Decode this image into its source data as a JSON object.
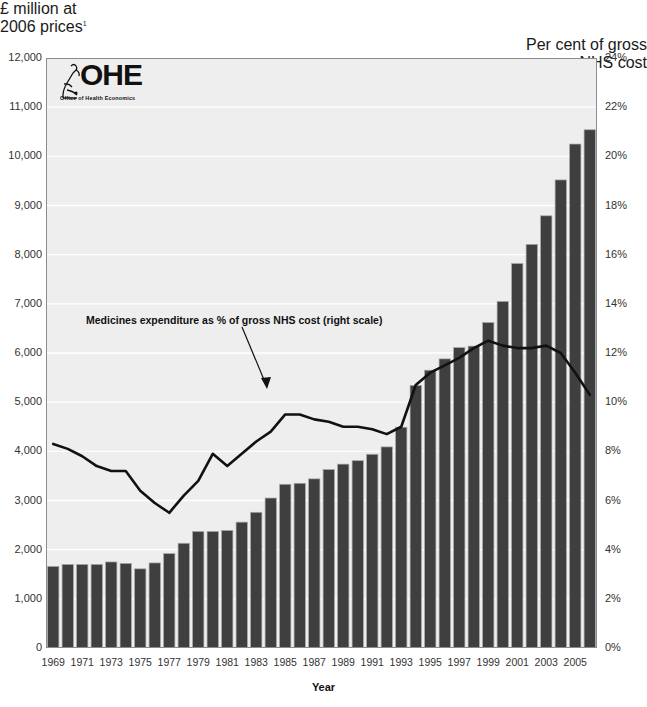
{
  "left_axis_caption": {
    "line1": "£ million at",
    "line2": "2006 prices",
    "footnote": "1"
  },
  "right_axis_caption": {
    "line1": "Per cent of gross",
    "line2": "NHS cost"
  },
  "logo": {
    "text": "OHE",
    "subtitle": "Office of Health Economics",
    "icon": "microscope-icon"
  },
  "annotation": "Medicines expenditure as % of gross NHS cost (right scale)",
  "x_axis_title": "Year",
  "colors": {
    "bar": "#3f3f3f",
    "bar_edge": "#a8a8a8",
    "line": "#111111",
    "plot_background": "#ededed",
    "gridline": "#ffffff",
    "axis": "#555555",
    "text": "#1a1a1a"
  },
  "chart_data": {
    "type": "bar",
    "title": "",
    "subtitle": "",
    "xlabel": "Year",
    "ylabel": "£ million at 2006 prices",
    "y2label": "Per cent of gross NHS cost",
    "ylim": [
      0,
      12000
    ],
    "y2lim": [
      0,
      24
    ],
    "yticks": [
      "0",
      "1,000",
      "2,000",
      "3,000",
      "4,000",
      "5,000",
      "6,000",
      "7,000",
      "8,000",
      "9,000",
      "10,000",
      "11,000",
      "12,000"
    ],
    "ytick_values": [
      0,
      1000,
      2000,
      3000,
      4000,
      5000,
      6000,
      7000,
      8000,
      9000,
      10000,
      11000,
      12000
    ],
    "y2ticks": [
      "0%",
      "2%",
      "4%",
      "6%",
      "8%",
      "10%",
      "12%",
      "14%",
      "16%",
      "18%",
      "20%",
      "22%",
      "24%"
    ],
    "y2tick_values": [
      0,
      2,
      4,
      6,
      8,
      10,
      12,
      14,
      16,
      18,
      20,
      22,
      24
    ],
    "grid": true,
    "legend_position": "annotation",
    "categories": [
      1969,
      1970,
      1971,
      1972,
      1973,
      1974,
      1975,
      1976,
      1977,
      1978,
      1979,
      1980,
      1981,
      1982,
      1983,
      1984,
      1985,
      1986,
      1987,
      1988,
      1989,
      1990,
      1991,
      1992,
      1993,
      1994,
      1995,
      1996,
      1997,
      1998,
      1999,
      2000,
      2001,
      2002,
      2003,
      2004,
      2005,
      2006
    ],
    "xtick_labels": [
      "1969",
      "1971",
      "1973",
      "1975",
      "1977",
      "1979",
      "1981",
      "1983",
      "1985",
      "1987",
      "1989",
      "1991",
      "1993",
      "1995",
      "1997",
      "1999",
      "2001",
      "2003",
      "2005"
    ],
    "series": [
      {
        "name": "Medicines expenditure (£ million at 2006 prices)",
        "type": "bar",
        "axis": "left",
        "values": [
          1660,
          1700,
          1700,
          1700,
          1750,
          1720,
          1610,
          1730,
          1920,
          2130,
          2370,
          2370,
          2390,
          2560,
          2760,
          3050,
          3330,
          3350,
          3440,
          3630,
          3740,
          3810,
          3940,
          4090,
          4490,
          5340,
          5650,
          5880,
          6110,
          6140,
          6620,
          7050,
          7820,
          8210,
          8790,
          9520,
          10250,
          10540
        ]
      },
      {
        "name": "Medicines expenditure as % of gross NHS cost",
        "type": "line",
        "axis": "right",
        "values": [
          8.3,
          8.1,
          7.8,
          7.4,
          7.2,
          7.2,
          6.4,
          5.9,
          5.5,
          6.2,
          6.8,
          7.9,
          7.4,
          7.9,
          8.4,
          8.8,
          9.5,
          9.5,
          9.3,
          9.2,
          9.0,
          9.0,
          8.9,
          8.7,
          9.0,
          10.7,
          11.2,
          11.5,
          11.8,
          12.2,
          12.5,
          12.3,
          12.2,
          12.2,
          12.3,
          12.0,
          11.2,
          10.3
        ]
      }
    ]
  }
}
